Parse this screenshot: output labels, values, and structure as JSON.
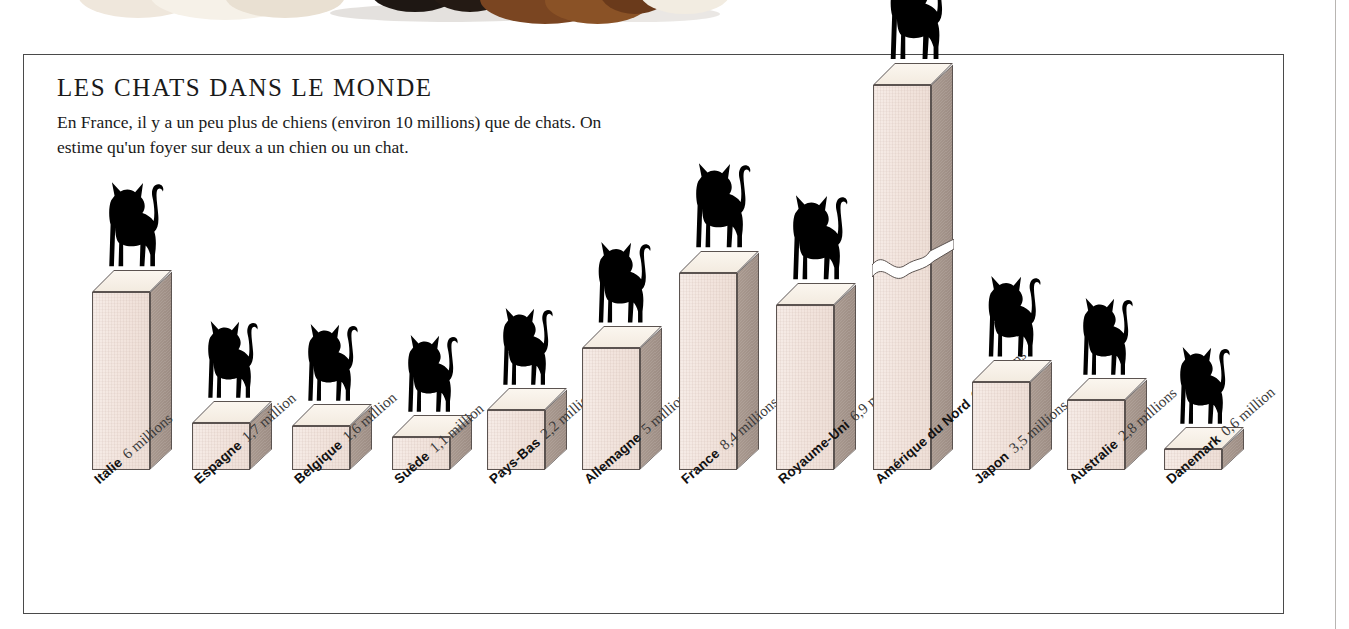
{
  "header": {
    "title": "LES CHATS DANS LE MONDE",
    "body": "En France, il y a un peu plus de chiens (environ 10 millions) que de chats. On estime qu'un foyer sur deux a un chien ou un chat."
  },
  "colors": {
    "bar_front": "#f2e4dd",
    "bar_side": "#a9998f",
    "bar_top": "#f3ebe0",
    "outline": "#5b5350",
    "cat": "#000000",
    "frame": "#4a4a4a"
  },
  "chart_data": {
    "type": "bar",
    "title": "LES CHATS DANS LE MONDE",
    "xlabel": "",
    "ylabel": "",
    "unit": "millions",
    "note": "Axis broken on the Amérique du Nord bar (60 millions) — bar drawn at reduced scale with a wavy break.",
    "axis_break": {
      "category": "Amérique du Nord",
      "present": true
    },
    "categories": [
      "Italie",
      "Espagne",
      "Belgique",
      "Suède",
      "Pays-Bas",
      "Allemagne",
      "France",
      "Royaume-Uni",
      "Amérique du Nord",
      "Japon",
      "Australie",
      "Danemark"
    ],
    "values": [
      6,
      1.7,
      1.6,
      1.1,
      2.2,
      5,
      8.4,
      6.9,
      60,
      3.5,
      2.8,
      0.6
    ],
    "value_labels": [
      "6 millions",
      "1,7 million",
      "1,6 million",
      "1,1 million",
      "2,2 millions",
      "5 millions",
      "8,4 millions",
      "6,9 millions",
      "60 millions",
      "3,5 millions",
      "2,8 millions",
      "0,6 million"
    ],
    "bars": [
      {
        "country": "Italie",
        "value": 6,
        "value_label": "6 millions",
        "x": 68,
        "h": 178,
        "break": false
      },
      {
        "country": "Espagne",
        "value": 1.7,
        "value_label": "1,7 million",
        "x": 168,
        "h": 47,
        "break": false
      },
      {
        "country": "Belgique",
        "value": 1.6,
        "value_label": "1,6 million",
        "x": 268,
        "h": 44,
        "break": false
      },
      {
        "country": "Suède",
        "value": 1.1,
        "value_label": "1,1 million",
        "x": 368,
        "h": 33,
        "break": false
      },
      {
        "country": "Pays-Bas",
        "value": 2.2,
        "value_label": "2,2 millions",
        "x": 463,
        "h": 60,
        "break": false
      },
      {
        "country": "Allemagne",
        "value": 5,
        "value_label": "5 millions",
        "x": 558,
        "h": 122,
        "break": false
      },
      {
        "country": "France",
        "value": 8.4,
        "value_label": "8,4 millions",
        "x": 655,
        "h": 197,
        "break": false
      },
      {
        "country": "Royaume-Uni",
        "value": 6.9,
        "value_label": "6,9 millions",
        "x": 752,
        "h": 165,
        "break": false
      },
      {
        "country": "Amérique du Nord",
        "value": 60,
        "value_label": "60 millions",
        "x": 849,
        "h": 385,
        "break": true
      },
      {
        "country": "Japon",
        "value": 3.5,
        "value_label": "3,5 millions",
        "x": 948,
        "h": 88,
        "break": false
      },
      {
        "country": "Australie",
        "value": 2.8,
        "value_label": "2,8 millions",
        "x": 1043,
        "h": 70,
        "break": false
      },
      {
        "country": "Danemark",
        "value": 0.6,
        "value_label": "0,6 million",
        "x": 1140,
        "h": 21,
        "break": false
      }
    ]
  }
}
